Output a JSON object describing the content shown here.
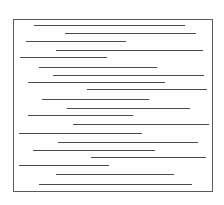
{
  "frame": {
    "x": 13,
    "y": 19,
    "w": 200,
    "h": 173,
    "border_color": "#5a5a5a"
  },
  "line_color": "#4a4a4a",
  "lines": [
    {
      "y": 25,
      "x1": 34,
      "x2": 185
    },
    {
      "y": 33,
      "x1": 65,
      "x2": 196
    },
    {
      "y": 41,
      "x1": 26,
      "x2": 126
    },
    {
      "y": 50,
      "x1": 56,
      "x2": 203
    },
    {
      "y": 57,
      "x1": 20,
      "x2": 107
    },
    {
      "y": 67,
      "x1": 39,
      "x2": 157
    },
    {
      "y": 75,
      "x1": 53,
      "x2": 204
    },
    {
      "y": 82,
      "x1": 28,
      "x2": 165
    },
    {
      "y": 89,
      "x1": 87,
      "x2": 207
    },
    {
      "y": 99,
      "x1": 42,
      "x2": 149
    },
    {
      "y": 108,
      "x1": 67,
      "x2": 190
    },
    {
      "y": 115,
      "x1": 28,
      "x2": 133
    },
    {
      "y": 124,
      "x1": 73,
      "x2": 209
    },
    {
      "y": 133,
      "x1": 19,
      "x2": 142
    },
    {
      "y": 142,
      "x1": 58,
      "x2": 198
    },
    {
      "y": 150,
      "x1": 33,
      "x2": 155
    },
    {
      "y": 157,
      "x1": 91,
      "x2": 206
    },
    {
      "y": 165,
      "x1": 19,
      "x2": 109
    },
    {
      "y": 174,
      "x1": 56,
      "x2": 174
    },
    {
      "y": 184,
      "x1": 39,
      "x2": 192
    }
  ]
}
